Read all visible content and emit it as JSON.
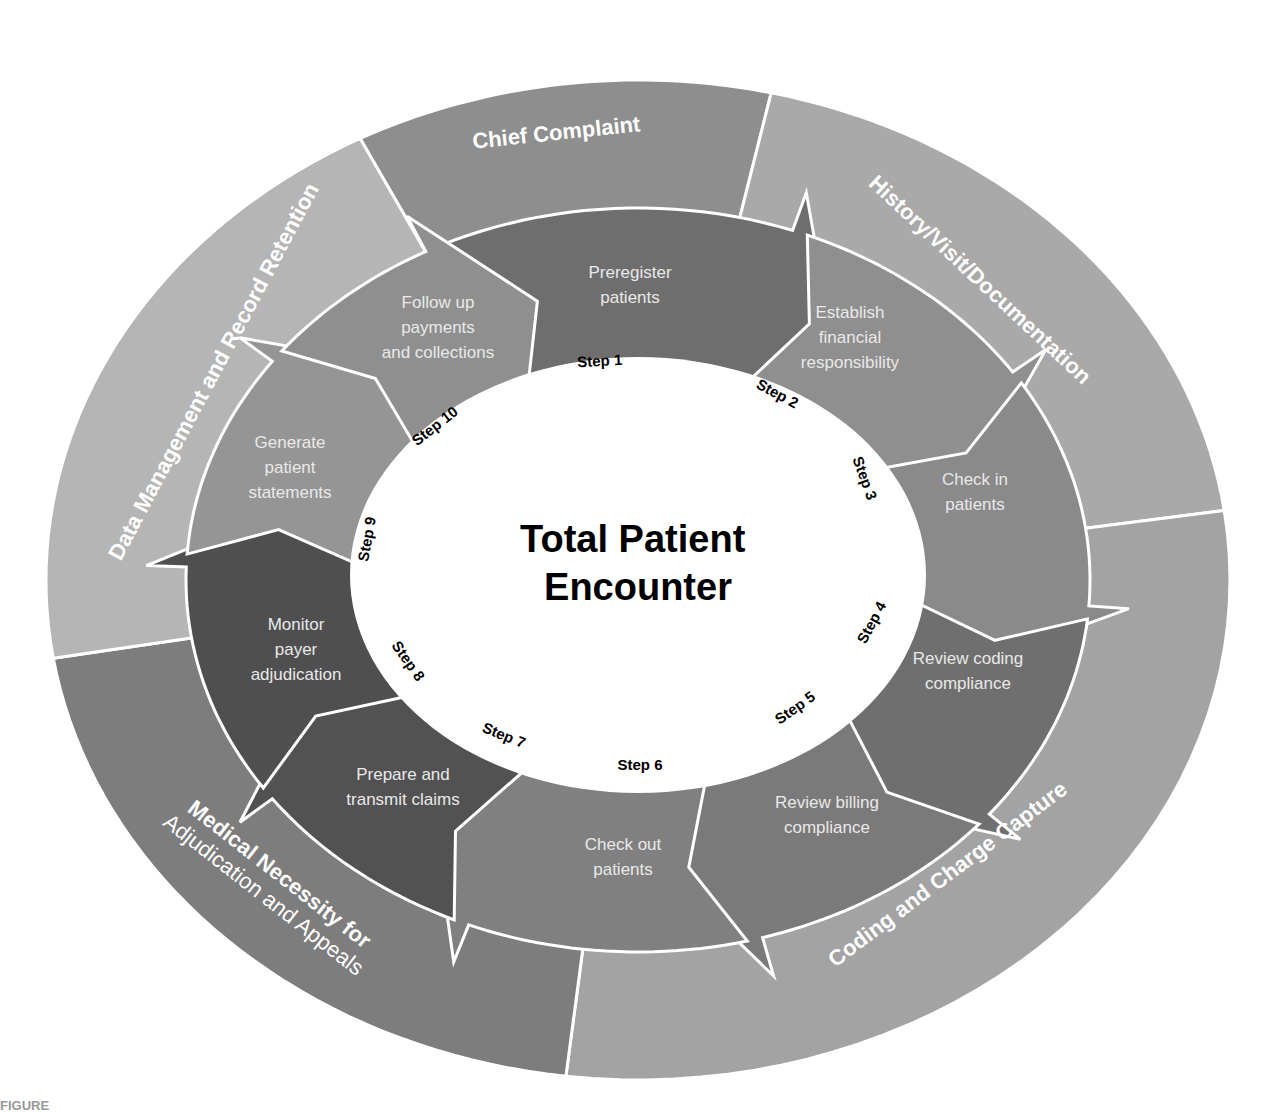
{
  "diagram": {
    "center_title": [
      "Total Patient",
      "Encounter"
    ],
    "figure_label": "FIGURE",
    "geometry": {
      "cx": 638,
      "cy": 580,
      "outer_rx": 592,
      "outer_ry": 500,
      "mid_rx": 452,
      "mid_ry": 372,
      "inner_rx": 288,
      "inner_ry": 218
    },
    "outer_segments": [
      {
        "id": "chief-complaint",
        "label": "Chief Complaint",
        "color": "#8e8e8e",
        "a0": -118,
        "a1": -77,
        "label_x": 557,
        "label_y": 140,
        "label_rot": -6
      },
      {
        "id": "history-visit-documentation",
        "label": "History/Visit/Documentation",
        "color": "#a9a9a9",
        "a0": -77,
        "a1": -8,
        "label_x": 975,
        "label_y": 285,
        "label_rot": 43
      },
      {
        "id": "coding-and-charge-capture",
        "label": "Coding and Charge Capture",
        "color": "#a3a3a3",
        "a0": -8,
        "a1": 97,
        "label_x": 952,
        "label_y": 880,
        "label_rot": -37
      },
      {
        "id": "medical-necessity",
        "label": "Medical Necessity for",
        "label2": "Adjudication and Appeals",
        "color": "#7d7d7d",
        "a0": 97,
        "a1": 171,
        "label_x": 275,
        "label_y": 880,
        "label_rot": 38
      },
      {
        "id": "data-management",
        "label": "Data Management and Record Retention",
        "color": "#b5b5b5",
        "a0": 171,
        "a1": 242,
        "label_x": 220,
        "label_y": 375,
        "label_rot": -62
      }
    ],
    "steps": [
      {
        "step": "Step 1",
        "text": [
          "Preregister",
          "patients"
        ],
        "color": "#6e6e6e",
        "a0": -112,
        "a1": -64,
        "text_x": 630,
        "text_y": 278,
        "num_x": 600,
        "num_y": 366,
        "num_rot": -3
      },
      {
        "step": "Step 2",
        "text": [
          "Establish",
          "financial",
          "responsibility"
        ],
        "color": "#8f8f8f",
        "a0": -64,
        "a1": -28,
        "text_x": 850,
        "text_y": 318,
        "num_x": 775,
        "num_y": 398,
        "num_rot": 28
      },
      {
        "step": "Step 3",
        "text": [
          "Check in",
          "patients"
        ],
        "color": "#8a8a8a",
        "a0": -28,
        "a1": 10,
        "text_x": 975,
        "text_y": 485,
        "num_x": 860,
        "num_y": 480,
        "num_rot": 70
      },
      {
        "step": "Step 4",
        "text": [
          "Review coding",
          "compliance"
        ],
        "color": "#6f6f6f",
        "a0": 10,
        "a1": 45,
        "text_x": 968,
        "text_y": 664,
        "num_x": 876,
        "num_y": 625,
        "num_rot": -62
      },
      {
        "step": "Step 5",
        "text": [
          "Review billing",
          "compliance"
        ],
        "color": "#7a7a7a",
        "a0": 45,
        "a1": 80,
        "text_x": 827,
        "text_y": 808,
        "num_x": 798,
        "num_y": 712,
        "num_rot": -35
      },
      {
        "step": "Step 6",
        "text": [
          "Check out",
          "patients"
        ],
        "color": "#808080",
        "a0": 80,
        "a1": 118,
        "text_x": 623,
        "text_y": 850,
        "num_x": 640,
        "num_y": 770,
        "num_rot": 0
      },
      {
        "step": "Step 7",
        "text": [
          "Prepare and",
          "transmit claims"
        ],
        "color": "#525252",
        "a0": 118,
        "a1": 150,
        "text_x": 403,
        "text_y": 780,
        "num_x": 502,
        "num_y": 740,
        "num_rot": 22
      },
      {
        "step": "Step 8",
        "text": [
          "Monitor",
          "payer",
          "adjudication"
        ],
        "color": "#4f4f4f",
        "a0": 150,
        "a1": 188,
        "text_x": 296,
        "text_y": 630,
        "num_x": 404,
        "num_y": 664,
        "num_rot": 55
      },
      {
        "step": "Step 9",
        "text": [
          "Generate",
          "patient",
          "statements"
        ],
        "color": "#959595",
        "a0": 188,
        "a1": 222,
        "text_x": 290,
        "text_y": 448,
        "num_x": 372,
        "num_y": 540,
        "num_rot": -80
      },
      {
        "step": "Step 10",
        "text": [
          "Follow up",
          "payments",
          "and collections"
        ],
        "color": "#8f8f8f",
        "a0": 222,
        "a1": 248,
        "text_x": 438,
        "text_y": 308,
        "num_x": 438,
        "num_y": 430,
        "num_rot": -38
      }
    ]
  }
}
